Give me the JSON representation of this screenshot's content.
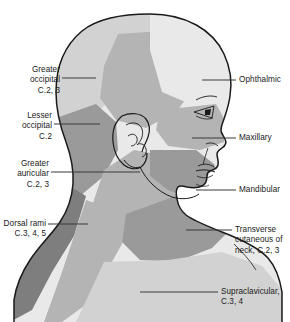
{
  "figure": {
    "colors": {
      "outline": "#1a1a1a",
      "leader_line": "#3a3a3a",
      "text": "#1a1a1a",
      "background": "#ffffff",
      "region_lightest": "#e9e9e9",
      "region_light": "#d2d2d2",
      "region_mid": "#b4b4b4",
      "region_dark": "#9a9a9a",
      "region_darkest": "#7e7e7e"
    }
  },
  "labels": {
    "left": [
      {
        "name": "greater-occipital",
        "text": "Greater\noccipital\nC.2, 3",
        "nerve": "Greater occipital",
        "roots": "C.2, 3"
      },
      {
        "name": "lesser-occipital",
        "text": "Lesser\noccipital\nC.2",
        "nerve": "Lesser occipital",
        "roots": "C.2"
      },
      {
        "name": "greater-auricular",
        "text": "Greater\nauricular\nC.2, 3",
        "nerve": "Greater auricular",
        "roots": "C.2, 3"
      },
      {
        "name": "dorsal-rami",
        "text": "Dorsal rami\nC.3, 4, 5",
        "nerve": "Dorsal rami",
        "roots": "C.3, 4, 5"
      }
    ],
    "right": [
      {
        "name": "ophthalmic",
        "text": "Ophthalmic",
        "nerve": "Ophthalmic",
        "roots": ""
      },
      {
        "name": "maxillary",
        "text": "Maxillary",
        "nerve": "Maxillary",
        "roots": ""
      },
      {
        "name": "mandibular",
        "text": "Mandibular",
        "nerve": "Mandibular",
        "roots": ""
      },
      {
        "name": "transverse-cutaneous-of-neck",
        "text": "Transverse\ncutaneous of\nneck, C.2, 3",
        "nerve": "Transverse cutaneous of neck",
        "roots": "C.2, 3"
      },
      {
        "name": "supraclavicular",
        "text": "Supraclavicular,\nC.3, 4",
        "nerve": "Supraclavicular",
        "roots": "C.3, 4"
      }
    ]
  }
}
